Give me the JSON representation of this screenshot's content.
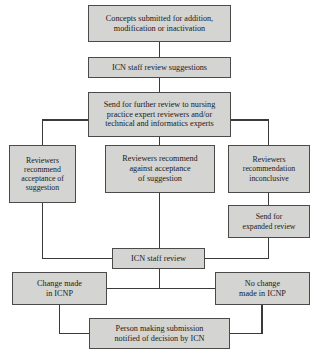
{
  "diagram": {
    "style": {
      "node_fill": "#d4d4d2",
      "node_border": "#4a4a4a",
      "connector_color": "#3a3a3a",
      "background": "#ffffff",
      "text_color": "#1a1a1a"
    },
    "nodes": [
      {
        "id": "concepts-submitted",
        "label": "Concepts submitted for addition,\nmodification or inactivation",
        "x": 88,
        "y": 5,
        "w": 143,
        "h": 37,
        "font": "fs-8"
      },
      {
        "id": "icn-staff-review-suggestions",
        "label": "ICN staff review suggestions",
        "x": 88,
        "y": 57,
        "w": 143,
        "h": 21,
        "font": "fs-8"
      },
      {
        "id": "send-further-review",
        "label": "Send for further review to nursing\npractice expert reviewers and/or\ntechnical and informatics experts",
        "x": 88,
        "y": 92,
        "w": 143,
        "h": 45,
        "font": "fs-8"
      },
      {
        "id": "reviewers-recommend-acceptance",
        "label": "Reviewers\nrecommend\nacceptance of\nsuggestion",
        "x": 9,
        "y": 145,
        "w": 67,
        "h": 58,
        "font": "fs-75"
      },
      {
        "id": "reviewers-recommend-against",
        "label": "Reviewers recommend\nagainst acceptance\nof suggestion",
        "x": 105,
        "y": 145,
        "w": 110,
        "h": 48,
        "font": "fs-8"
      },
      {
        "id": "reviewers-inconclusive",
        "label": "Reviewers\nrecommendation\ninconclusive",
        "x": 228,
        "y": 145,
        "w": 82,
        "h": 48,
        "font": "fs-75"
      },
      {
        "id": "send-expanded-review",
        "label": "Send for\nexpanded review",
        "x": 228,
        "y": 205,
        "w": 82,
        "h": 33,
        "font": "fs-75"
      },
      {
        "id": "icn-staff-review",
        "label": "ICN staff review",
        "x": 112,
        "y": 248,
        "w": 93,
        "h": 21,
        "font": "fs-8"
      },
      {
        "id": "change-made-in-icnp",
        "label": "Change made\nin ICNP",
        "x": 12,
        "y": 272,
        "w": 95,
        "h": 33,
        "font": "fs-8"
      },
      {
        "id": "no-change-made-in-icnp",
        "label": "No change\nmade in ICNP",
        "x": 215,
        "y": 272,
        "w": 95,
        "h": 33,
        "font": "fs-8"
      },
      {
        "id": "person-notified",
        "label": "Person making submission\nnotified of decision by ICN",
        "x": 89,
        "y": 318,
        "w": 141,
        "h": 31,
        "font": "fs-8"
      }
    ],
    "connectors": [
      {
        "id": "concepts-to-icn-suggestions",
        "path": "M 159.5 42 L 159.5 57"
      },
      {
        "id": "icn-suggestions-to-send-review",
        "path": "M 159.5 78 L 159.5 92"
      },
      {
        "id": "send-review-to-left-branch",
        "path": "M 88 120 L 42.5 120 L 42.5 145"
      },
      {
        "id": "send-review-to-middle-branch",
        "path": "M 159.5 137 L 159.5 145"
      },
      {
        "id": "send-review-to-right-branch",
        "path": "M 231 120 L 268.5 120 L 268.5 145"
      },
      {
        "id": "acceptance-to-icn-staff-review",
        "path": "M 42.5 203 L 42.5 258.5 L 112 258.5"
      },
      {
        "id": "against-to-icn-staff-review",
        "path": "M 159.5 193 L 159.5 248"
      },
      {
        "id": "inconclusive-to-expanded-review",
        "path": "M 268.5 193 L 268.5 205"
      },
      {
        "id": "expanded-review-to-icn-staff-review",
        "path": "M 268.5 238 L 268.5 258.5 L 205 258.5"
      },
      {
        "id": "icn-staff-review-to-outcome-bus",
        "path": "M 159.5 269 L 159.5 288.5"
      },
      {
        "id": "outcome-bus-left",
        "path": "M 159.5 288.5 L 107 288.5"
      },
      {
        "id": "outcome-bus-right",
        "path": "M 159.5 288.5 L 215 288.5"
      },
      {
        "id": "change-to-person-notified",
        "path": "M 59.5 305 L 59.5 333.5 L 89 333.5"
      },
      {
        "id": "no-change-to-person-notified",
        "path": "M 262 305 L 262 333.5 L 230 333.5"
      }
    ]
  }
}
